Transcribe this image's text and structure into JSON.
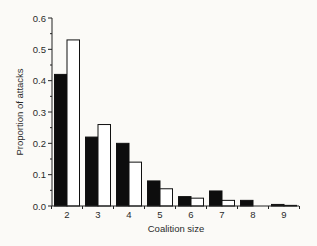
{
  "chart_data": {
    "type": "bar",
    "title": "",
    "xlabel": "Coalition size",
    "ylabel": "Proportion of attacks",
    "categories": [
      "2",
      "3",
      "4",
      "5",
      "6",
      "7",
      "8",
      "9"
    ],
    "series": [
      {
        "name": "Series A (black)",
        "color": "#0d0d0d",
        "values": [
          0.42,
          0.22,
          0.2,
          0.08,
          0.03,
          0.048,
          0.018,
          0.005
        ]
      },
      {
        "name": "Series B (white)",
        "color": "#ffffff",
        "values": [
          0.53,
          0.26,
          0.14,
          0.055,
          0.025,
          0.018,
          0.0,
          0.002
        ]
      }
    ],
    "ylim": [
      0.0,
      0.6
    ],
    "yticks": [
      "0.0",
      "0.1",
      "0.2",
      "0.3",
      "0.4",
      "0.5",
      "0.6"
    ],
    "grid": false,
    "legend": "none"
  }
}
